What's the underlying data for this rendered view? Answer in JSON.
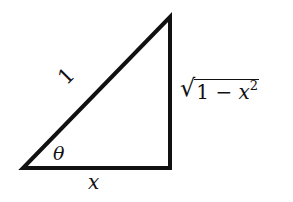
{
  "diagram": {
    "type": "right-triangle",
    "stroke_color": "#111111",
    "background": "#ffffff",
    "vertices": {
      "bottom_left": [
        23,
        168
      ],
      "bottom_right": [
        170,
        168
      ],
      "top_right": [
        170,
        17
      ]
    },
    "labels": {
      "hypotenuse": "1",
      "angle": "θ",
      "base": "x",
      "side_sqrt": "√",
      "side_radicand_a": "1 − ",
      "side_radicand_var": "x",
      "side_exponent": "2"
    }
  }
}
